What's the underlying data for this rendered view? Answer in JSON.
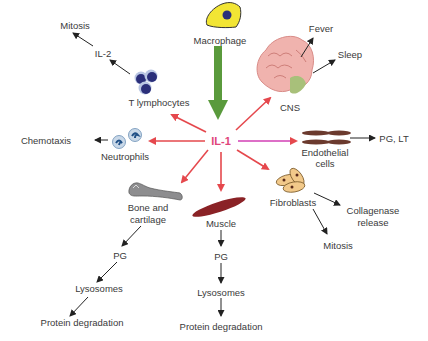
{
  "diagram": {
    "center": {
      "label": "IL-1",
      "color": "#e0457a"
    },
    "source": {
      "label": "Macrophage",
      "arrow_color": "#5a9a3c",
      "icon": "macrophage-cell-icon"
    },
    "targets": {
      "cns": {
        "label": "CNS",
        "icon": "brain-icon",
        "effects": [
          "Fever",
          "Sleep"
        ]
      },
      "endothelial": {
        "label_line1": "Endothelial",
        "label_line2": "cells",
        "icon": "endothelial-cells-icon",
        "effects": [
          "PG, LT"
        ]
      },
      "fibroblasts": {
        "label": "Fibroblasts",
        "icon": "fibroblasts-icon",
        "effects": [
          {
            "line1": "Collagenase",
            "line2": "release"
          },
          "Mitosis"
        ]
      },
      "muscle": {
        "label": "Muscle",
        "icon": "muscle-icon",
        "chain": [
          "PG",
          "Lysosomes",
          "Protein degradation"
        ]
      },
      "bone": {
        "label_line1": "Bone and",
        "label_line2": "cartilage",
        "icon": "bone-icon",
        "chain": [
          "PG",
          "Lysosomes",
          "Protein degradation"
        ]
      },
      "neutrophils": {
        "label": "Neutrophils",
        "icon": "neutrophils-icon",
        "effects": [
          "Chemotaxis"
        ]
      },
      "t_lymphocytes": {
        "label": "T lymphocytes",
        "icon": "t-lymphocytes-icon",
        "chain": [
          "IL-2",
          "Mitosis"
        ]
      }
    },
    "colors": {
      "red_arrow": "#e5484d",
      "black_arrow": "#222222",
      "magenta_arrow": "#d23fb4"
    }
  }
}
